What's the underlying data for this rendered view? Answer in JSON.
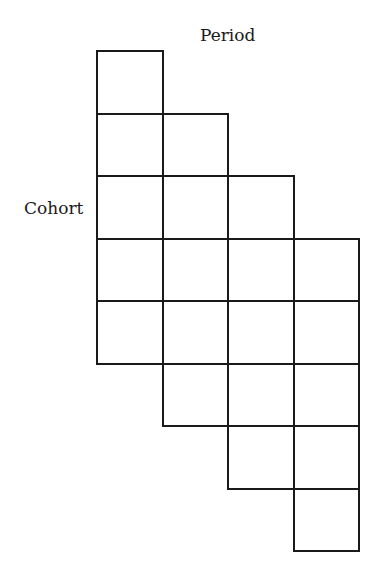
{
  "diagram": {
    "title_top": "Period",
    "title_left": "Cohort",
    "grid": {
      "columns": 4,
      "rows_per_column": 5,
      "column_row_offsets": [
        0,
        1,
        2,
        3
      ],
      "origin_x": 97,
      "origin_y": 51,
      "cell_width": 65.5,
      "cell_height": 62.5,
      "line_color": "#1a1a1a"
    }
  }
}
